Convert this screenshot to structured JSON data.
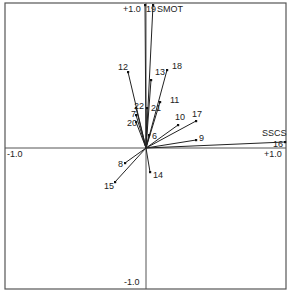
{
  "diagram": {
    "type": "biplot",
    "frame": {
      "x0": 5,
      "y0": 3,
      "x1": 286,
      "y1": 289
    },
    "origin_px": {
      "x": 146,
      "y": 148
    },
    "axis_labels": {
      "top": "+1.0",
      "bottom": "-1.0",
      "left": "-1.0",
      "right": "+1.0"
    },
    "vectors": [
      {
        "label": "19",
        "x": 0.0,
        "y": 0.98,
        "px": [
          145,
          5
        ],
        "lx": 146,
        "ly": 12,
        "anchor": "start"
      },
      {
        "label": "SMOT",
        "x": 0.05,
        "y": 0.98,
        "px": [
          153,
          5
        ],
        "lx": 157,
        "ly": 12,
        "anchor": "start"
      },
      {
        "label": "12",
        "x": -0.13,
        "y": 0.52,
        "px": [
          128,
          72
        ],
        "lx": 118,
        "ly": 70,
        "anchor": "start"
      },
      {
        "label": "13",
        "x": 0.04,
        "y": 0.47,
        "px": [
          151,
          80
        ],
        "lx": 155,
        "ly": 75,
        "anchor": "start"
      },
      {
        "label": "18",
        "x": 0.15,
        "y": 0.54,
        "px": [
          167,
          70
        ],
        "lx": 172,
        "ly": 69,
        "anchor": "start"
      },
      {
        "label": "11",
        "x": 0.1,
        "y": 0.32,
        "px": [
          160,
          102
        ],
        "lx": 170,
        "ly": 103,
        "anchor": "start"
      },
      {
        "label": "21",
        "x": 0.01,
        "y": 0.28,
        "px": [
          147,
          108
        ],
        "lx": 151,
        "ly": 111,
        "anchor": "start"
      },
      {
        "label": "22",
        "x": -0.07,
        "y": 0.28,
        "px": [
          136,
          108
        ],
        "lx": 134,
        "ly": 109,
        "anchor": "start"
      },
      {
        "label": "7",
        "x": -0.07,
        "y": 0.23,
        "px": [
          136,
          115
        ],
        "lx": 131,
        "ly": 117,
        "anchor": "start"
      },
      {
        "label": "20",
        "x": -0.07,
        "y": 0.18,
        "px": [
          136,
          122
        ],
        "lx": 127,
        "ly": 126,
        "anchor": "start"
      },
      {
        "label": "10",
        "x": 0.23,
        "y": 0.16,
        "px": [
          178,
          125
        ],
        "lx": 175,
        "ly": 120,
        "anchor": "start"
      },
      {
        "label": "17",
        "x": 0.36,
        "y": 0.19,
        "px": [
          196,
          121
        ],
        "lx": 192,
        "ly": 117,
        "anchor": "start"
      },
      {
        "label": "6",
        "x": 0.02,
        "y": 0.09,
        "px": [
          149,
          135
        ],
        "lx": 152,
        "ly": 139,
        "anchor": "start"
      },
      {
        "label": "9",
        "x": 0.36,
        "y": 0.06,
        "px": [
          196,
          140
        ],
        "lx": 199,
        "ly": 141,
        "anchor": "start"
      },
      {
        "label": "SSCS",
        "x": 0.99,
        "y": 0.04,
        "px": [
          285,
          142
        ],
        "lx": 262,
        "ly": 136,
        "anchor": "start"
      },
      {
        "label": "16",
        "x": 0.99,
        "y": 0.04,
        "px": [
          285,
          142
        ],
        "lx": 273,
        "ly": 147,
        "anchor": "start"
      },
      {
        "label": "8",
        "x": -0.15,
        "y": -0.1,
        "px": [
          125,
          163
        ],
        "lx": 118,
        "ly": 167,
        "anchor": "start"
      },
      {
        "label": "15",
        "x": -0.22,
        "y": -0.24,
        "px": [
          115,
          182
        ],
        "lx": 104,
        "ly": 189,
        "anchor": "start"
      },
      {
        "label": "14",
        "x": 0.03,
        "y": -0.17,
        "px": [
          150,
          172
        ],
        "lx": 153,
        "ly": 178,
        "anchor": "start"
      }
    ]
  }
}
